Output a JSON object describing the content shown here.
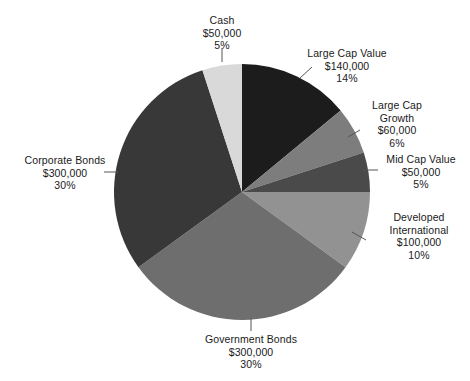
{
  "chart_data": {
    "type": "pie",
    "title": "",
    "subtitle": "",
    "xlabel": "",
    "ylabel": "",
    "legend_position": "none",
    "grid": false,
    "value_prefix": "$",
    "total_value": 1000000,
    "total_percent": 100,
    "categories": [
      "Large Cap Value",
      "Large Cap Growth",
      "Mid Cap Value",
      "Developed International",
      "Government Bonds",
      "Corporate Bonds",
      "Cash"
    ],
    "values": [
      140000,
      60000,
      50000,
      100000,
      300000,
      300000,
      50000
    ],
    "percents": [
      14,
      6,
      5,
      10,
      30,
      30,
      5
    ],
    "slices": [
      {
        "name": "Large Cap Value",
        "amount_label": "$140,000",
        "percent_label": "14%",
        "value": 140000,
        "percent": 14,
        "color": "#1c1c1c",
        "start_angle": 0,
        "end_angle": 50.4
      },
      {
        "name": "Large Cap Growth",
        "amount_label": "$60,000",
        "percent_label": "6%",
        "value": 60000,
        "percent": 6,
        "color": "#7d7d7d",
        "start_angle": 50.4,
        "end_angle": 72.0
      },
      {
        "name": "Mid Cap Value",
        "amount_label": "$50,000",
        "percent_label": "5%",
        "value": 50000,
        "percent": 5,
        "color": "#4a4a4a",
        "start_angle": 72.0,
        "end_angle": 90.0
      },
      {
        "name": "Developed International",
        "amount_label": "$100,000",
        "percent_label": "10%",
        "value": 100000,
        "percent": 10,
        "color": "#929292",
        "start_angle": 90.0,
        "end_angle": 126.0
      },
      {
        "name": "Government Bonds",
        "amount_label": "$300,000",
        "percent_label": "30%",
        "value": 300000,
        "percent": 30,
        "color": "#6e6e6e",
        "start_angle": 126.0,
        "end_angle": 234.0
      },
      {
        "name": "Corporate Bonds",
        "amount_label": "$300,000",
        "percent_label": "30%",
        "value": 300000,
        "percent": 30,
        "color": "#383838",
        "start_angle": 234.0,
        "end_angle": 342.0
      },
      {
        "name": "Cash",
        "amount_label": "$50,000",
        "percent_label": "5%",
        "value": 50000,
        "percent": 5,
        "color": "#d9d9d9",
        "start_angle": 342.0,
        "end_angle": 360.0
      }
    ]
  },
  "labels": {
    "cash": {
      "name": "Cash",
      "amount": "$50,000",
      "percent": "5%"
    },
    "large_cap_value": {
      "name": "Large Cap Value",
      "amount": "$140,000",
      "percent": "14%"
    },
    "large_cap_growth": {
      "name_line1": "Large Cap",
      "name_line2": "Growth",
      "amount": "$60,000",
      "percent": "6%"
    },
    "mid_cap_value": {
      "name": "Mid Cap Value",
      "amount": "$50,000",
      "percent": "5%"
    },
    "developed_international": {
      "name_line1": "Developed",
      "name_line2": "International",
      "amount": "$100,000",
      "percent": "10%"
    },
    "government_bonds": {
      "name": "Government Bonds",
      "amount": "$300,000",
      "percent": "30%"
    },
    "corporate_bonds": {
      "name": "Corporate Bonds",
      "amount": "$300,000",
      "percent": "30%"
    }
  }
}
